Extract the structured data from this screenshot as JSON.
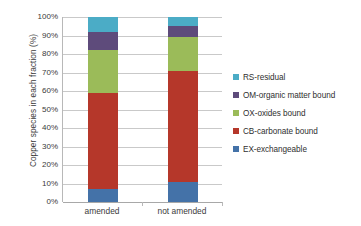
{
  "chart_data": {
    "type": "bar",
    "subtype": "stacked-bar-100-percent",
    "title": "",
    "xlabel": "",
    "ylabel": "Copper species in each fraction (%)",
    "ylim": [
      0,
      100
    ],
    "grid": true,
    "legend_position": "right",
    "categories": [
      "amended",
      "not amended"
    ],
    "ytick_labels": [
      "0%",
      "10%",
      "20%",
      "30%",
      "40%",
      "50%",
      "60%",
      "70%",
      "80%",
      "90%",
      "100%"
    ],
    "ytick_values": [
      0,
      10,
      20,
      30,
      40,
      50,
      60,
      70,
      80,
      90,
      100
    ],
    "stack_order_bottom_to_top": [
      "EX-exchangeable",
      "CB-carbonate bound",
      "OX-oxides bound",
      "OM-organic matter bound",
      "RS-residual"
    ],
    "series": [
      {
        "name": "EX-exchangeable",
        "color": "#4472a8",
        "values": [
          7,
          11
        ]
      },
      {
        "name": "CB-carbonate bound",
        "color": "#b5372a",
        "values": [
          52,
          60
        ]
      },
      {
        "name": "OX-oxides bound",
        "color": "#9bbb59",
        "values": [
          23,
          18
        ]
      },
      {
        "name": "OM-organic matter bound",
        "color": "#5e4b7b",
        "values": [
          10,
          6
        ]
      },
      {
        "name": "RS-residual",
        "color": "#4bacc6",
        "values": [
          8,
          5
        ]
      }
    ],
    "legend_entries": [
      {
        "label": "RS-residual",
        "color": "#4bacc6"
      },
      {
        "label": "OM-organic matter bound",
        "color": "#5e4b7b"
      },
      {
        "label": "OX-oxides bound",
        "color": "#9bbb59"
      },
      {
        "label": "CB-carbonate bound",
        "color": "#b5372a"
      },
      {
        "label": "EX-exchangeable",
        "color": "#4472a8"
      }
    ]
  }
}
